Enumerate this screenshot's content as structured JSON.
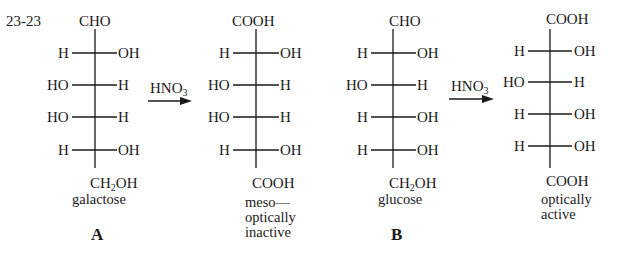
{
  "problem_number": "23-23",
  "reagent": "HNO",
  "reagent_sub": "3",
  "structures": [
    {
      "id": "galactose",
      "top": "CHO",
      "rows": [
        {
          "left": "H",
          "right": "OH"
        },
        {
          "left": "HO",
          "right": "H"
        },
        {
          "left": "HO",
          "right": "H"
        },
        {
          "left": "H",
          "right": "OH"
        }
      ],
      "bottom_main": "CH",
      "bottom_sub": "2",
      "bottom_tail": "OH",
      "name": "galactose",
      "letter": "A"
    },
    {
      "id": "galactaric-acid",
      "top": "COOH",
      "rows": [
        {
          "left": "H",
          "right": "OH"
        },
        {
          "left": "HO",
          "right": "H"
        },
        {
          "left": "HO",
          "right": "H"
        },
        {
          "left": "H",
          "right": "OH"
        }
      ],
      "bottom": "COOH",
      "note_lines": [
        "meso—",
        "optically",
        "inactive"
      ]
    },
    {
      "id": "glucose",
      "top": "CHO",
      "rows": [
        {
          "left": "H",
          "right": "OH"
        },
        {
          "left": "HO",
          "right": "H"
        },
        {
          "left": "H",
          "right": "OH"
        },
        {
          "left": "H",
          "right": "OH"
        }
      ],
      "bottom_main": "CH",
      "bottom_sub": "2",
      "bottom_tail": "OH",
      "name": "glucose",
      "letter": "B"
    },
    {
      "id": "glucaric-acid",
      "top": "COOH",
      "rows": [
        {
          "left": "H",
          "right": "OH"
        },
        {
          "left": "HO",
          "right": "H"
        },
        {
          "left": "H",
          "right": "OH"
        },
        {
          "left": "H",
          "right": "OH"
        }
      ],
      "bottom": "COOH",
      "note_lines": [
        "optically",
        "active"
      ]
    }
  ]
}
